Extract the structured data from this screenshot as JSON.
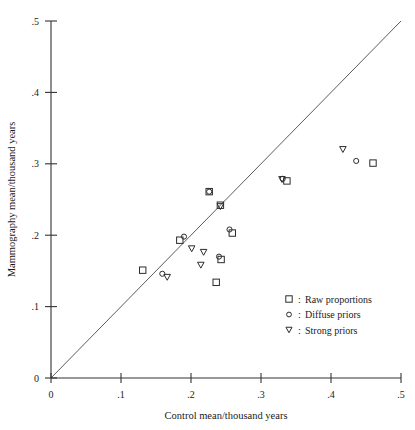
{
  "chart_data": {
    "type": "scatter",
    "title": "",
    "xlabel": "Control mean/thousand years",
    "ylabel": "Mammography mean/thousand years",
    "xlim": [
      0,
      0.5
    ],
    "ylim": [
      0,
      0.5
    ],
    "xticks": [
      0,
      0.1,
      0.2,
      0.3,
      0.4,
      0.5
    ],
    "yticks": [
      0,
      0.1,
      0.2,
      0.3,
      0.4,
      0.5
    ],
    "xticklabels": [
      "0",
      ".1",
      ".2",
      ".3",
      ".4",
      ".5"
    ],
    "yticklabels": [
      "0",
      ".1",
      ".2",
      ".3",
      ".4",
      ".5"
    ],
    "grid": false,
    "legend_position": "lower-right",
    "reference_line": {
      "label": "y = x",
      "from": [
        0,
        0
      ],
      "to": [
        0.5,
        0.5
      ]
    },
    "series": [
      {
        "name": "Raw proportions",
        "marker": "square",
        "points": [
          [
            0.131,
            0.151
          ],
          [
            0.184,
            0.193
          ],
          [
            0.226,
            0.261
          ],
          [
            0.242,
            0.242
          ],
          [
            0.236,
            0.134
          ],
          [
            0.243,
            0.166
          ],
          [
            0.259,
            0.203
          ],
          [
            0.337,
            0.276
          ],
          [
            0.46,
            0.301
          ]
        ]
      },
      {
        "name": "Diffuse priors",
        "marker": "circle",
        "points": [
          [
            0.159,
            0.146
          ],
          [
            0.19,
            0.198
          ],
          [
            0.226,
            0.261
          ],
          [
            0.24,
            0.17
          ],
          [
            0.255,
            0.208
          ],
          [
            0.331,
            0.279
          ],
          [
            0.436,
            0.304
          ]
        ]
      },
      {
        "name": "Strong priors",
        "marker": "triangle-down",
        "points": [
          [
            0.166,
            0.141
          ],
          [
            0.201,
            0.181
          ],
          [
            0.218,
            0.176
          ],
          [
            0.214,
            0.158
          ],
          [
            0.242,
            0.24
          ],
          [
            0.33,
            0.278
          ],
          [
            0.417,
            0.32
          ]
        ]
      }
    ]
  },
  "legend": {
    "separator": ":",
    "entries": [
      {
        "marker": "square",
        "label": "Raw proportions"
      },
      {
        "marker": "circle",
        "label": "Diffuse priors"
      },
      {
        "marker": "triangle-down",
        "label": "Strong priors"
      }
    ]
  }
}
